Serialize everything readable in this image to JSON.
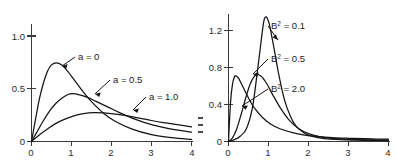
{
  "figure": {
    "title": "",
    "panel_count": 2
  },
  "chart_data": [
    {
      "type": "line",
      "panel": "left",
      "title": "",
      "xlabel": "",
      "ylabel": "",
      "xlim": [
        0,
        4
      ],
      "ylim": [
        0,
        1.15
      ],
      "grid": false,
      "legend_position": "inline-annotations",
      "xticks": [
        0,
        1,
        2,
        3,
        4
      ],
      "xticklabels": [
        "0",
        "1",
        "2",
        "3",
        "4"
      ],
      "yticks": [
        0,
        0.5,
        1.0
      ],
      "yticklabels": [
        "0",
        "0.5",
        "1.0"
      ],
      "series": [
        {
          "name": "a = 0",
          "label": "a = 0",
          "peak_x": 0.62,
          "peak_y": 0.75,
          "x": [
            0,
            0.1,
            0.2,
            0.3,
            0.4,
            0.5,
            0.62,
            0.75,
            0.9,
            1.1,
            1.3,
            1.5,
            1.8,
            2.1,
            2.5,
            3.0,
            3.5,
            4.0
          ],
          "y": [
            0,
            0.21,
            0.41,
            0.56,
            0.67,
            0.73,
            0.75,
            0.73,
            0.67,
            0.57,
            0.47,
            0.38,
            0.27,
            0.19,
            0.12,
            0.065,
            0.036,
            0.02
          ]
        },
        {
          "name": "a = 0.5",
          "label": "a = 0.5",
          "peak_x": 1.02,
          "peak_y": 0.455,
          "x": [
            0,
            0.15,
            0.3,
            0.45,
            0.6,
            0.75,
            0.9,
            1.02,
            1.2,
            1.4,
            1.6,
            1.9,
            2.2,
            2.6,
            3.0,
            3.4,
            3.7,
            4.0
          ],
          "y": [
            0,
            0.1,
            0.2,
            0.29,
            0.36,
            0.41,
            0.445,
            0.455,
            0.445,
            0.42,
            0.385,
            0.33,
            0.275,
            0.21,
            0.16,
            0.125,
            0.105,
            0.09
          ]
        },
        {
          "name": "a = 1.0",
          "label": "a = 1.0",
          "peak_x": 1.55,
          "peak_y": 0.275,
          "x": [
            0,
            0.2,
            0.4,
            0.6,
            0.85,
            1.1,
            1.3,
            1.55,
            1.8,
            2.1,
            2.4,
            2.7,
            3.0,
            3.3,
            3.6,
            4.0
          ],
          "y": [
            0,
            0.065,
            0.12,
            0.17,
            0.215,
            0.248,
            0.265,
            0.275,
            0.272,
            0.26,
            0.243,
            0.222,
            0.2,
            0.18,
            0.162,
            0.14
          ]
        }
      ]
    },
    {
      "type": "line",
      "panel": "right",
      "title": "",
      "xlabel": "",
      "ylabel": "",
      "xlim": [
        0,
        4
      ],
      "ylim": [
        0,
        1.4
      ],
      "grid": false,
      "legend_position": "inline-annotations",
      "xticks": [
        0,
        1,
        2,
        3,
        4
      ],
      "xticklabels": [
        "0",
        "1",
        "2",
        "3",
        "4"
      ],
      "yticks": [
        0,
        0.4,
        0.8,
        1.2
      ],
      "yticklabels": [
        "0",
        "0.4",
        "0.8",
        "1.2"
      ],
      "series": [
        {
          "name": "B2 = 0.1",
          "label": "B² = 0.1",
          "peak_x": 0.9,
          "peak_y": 1.33,
          "x": [
            0,
            0.15,
            0.3,
            0.45,
            0.6,
            0.72,
            0.82,
            0.9,
            1.0,
            1.12,
            1.25,
            1.4,
            1.55,
            1.7,
            1.9,
            2.1,
            2.4,
            2.8,
            3.2,
            3.6,
            4.0
          ],
          "y": [
            0,
            0.02,
            0.06,
            0.14,
            0.37,
            0.75,
            1.1,
            1.33,
            1.3,
            1.05,
            0.74,
            0.45,
            0.27,
            0.16,
            0.09,
            0.055,
            0.032,
            0.02,
            0.015,
            0.012,
            0.01
          ]
        },
        {
          "name": "B2 = 0.5",
          "label": "B² = 0.5",
          "peak_x": 0.68,
          "peak_y": 0.72,
          "x": [
            0,
            0.1,
            0.2,
            0.32,
            0.45,
            0.56,
            0.68,
            0.8,
            0.95,
            1.1,
            1.3,
            1.5,
            1.75,
            2.0,
            2.3,
            2.7,
            3.1,
            3.5,
            4.0
          ],
          "y": [
            0,
            0.04,
            0.13,
            0.3,
            0.5,
            0.64,
            0.72,
            0.71,
            0.63,
            0.51,
            0.36,
            0.24,
            0.14,
            0.085,
            0.05,
            0.03,
            0.022,
            0.018,
            0.015
          ]
        },
        {
          "name": "B2 = 2.0",
          "label": "B² = 2.0",
          "peak_x": 0.18,
          "peak_y": 0.71,
          "x": [
            0,
            0.05,
            0.1,
            0.15,
            0.18,
            0.25,
            0.35,
            0.5,
            0.65,
            0.85,
            1.05,
            1.3,
            1.6,
            1.9,
            2.2,
            2.6,
            3.0,
            3.4,
            3.7,
            4.0
          ],
          "y": [
            0,
            0.42,
            0.62,
            0.7,
            0.71,
            0.685,
            0.6,
            0.47,
            0.36,
            0.26,
            0.19,
            0.135,
            0.095,
            0.07,
            0.055,
            0.042,
            0.035,
            0.03,
            0.027,
            0.025
          ]
        }
      ]
    }
  ]
}
